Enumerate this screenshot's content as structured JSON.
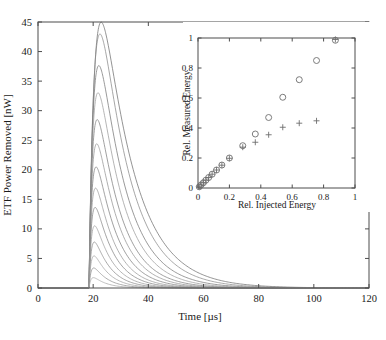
{
  "chart_data": [
    {
      "id": "main",
      "type": "line",
      "title": "",
      "xlabel": "Time [µs]",
      "ylabel": "ETF Power Removed [nW]",
      "xlim": [
        0,
        120
      ],
      "ylim": [
        0,
        45
      ],
      "xticks": [
        0,
        20,
        40,
        60,
        80,
        100,
        120
      ],
      "yticks": [
        0,
        5,
        10,
        15,
        20,
        25,
        30,
        35,
        40,
        45
      ],
      "grid": false,
      "legend": "none",
      "pulse_start_us": 18.5,
      "series_note": "14 pulse-response curves; each rises sharply at t=18.5 us, peaks between t=20 and t=25 us, then decays exponentially toward 0 by t~90 us.",
      "series": [
        {
          "name": "curve-01",
          "peak_value": 43.0,
          "peak_time_us": 24.6,
          "decay_tau_us": 11.5,
          "rise_tau_us": 2.6,
          "color": "#707070"
        },
        {
          "name": "curve-02",
          "peak_value": 42.2,
          "peak_time_us": 23.4,
          "decay_tau_us": 10.6,
          "rise_tau_us": 2.3,
          "color": "#8a8a8a"
        },
        {
          "name": "curve-03",
          "peak_value": 37.6,
          "peak_time_us": 22.2,
          "decay_tau_us": 9.8,
          "rise_tau_us": 2.0,
          "color": "#787878"
        },
        {
          "name": "curve-04",
          "peak_value": 33.0,
          "peak_time_us": 21.6,
          "decay_tau_us": 9.2,
          "rise_tau_us": 1.8,
          "color": "#9c9c9c"
        },
        {
          "name": "curve-05",
          "peak_value": 28.4,
          "peak_time_us": 21.2,
          "decay_tau_us": 8.6,
          "rise_tau_us": 1.6,
          "color": "#808080"
        },
        {
          "name": "curve-06",
          "peak_value": 24.2,
          "peak_time_us": 20.9,
          "decay_tau_us": 8.1,
          "rise_tau_us": 1.5,
          "color": "#949494"
        },
        {
          "name": "curve-07",
          "peak_value": 20.2,
          "peak_time_us": 20.6,
          "decay_tau_us": 7.6,
          "rise_tau_us": 1.35,
          "color": "#828282"
        },
        {
          "name": "curve-08",
          "peak_value": 16.6,
          "peak_time_us": 20.4,
          "decay_tau_us": 7.1,
          "rise_tau_us": 1.25,
          "color": "#9a9a9a"
        },
        {
          "name": "curve-09",
          "peak_value": 13.3,
          "peak_time_us": 20.2,
          "decay_tau_us": 6.7,
          "rise_tau_us": 1.15,
          "color": "#868686"
        },
        {
          "name": "curve-10",
          "peak_value": 10.3,
          "peak_time_us": 20.1,
          "decay_tau_us": 6.3,
          "rise_tau_us": 1.05,
          "color": "#9e9e9e"
        },
        {
          "name": "curve-11",
          "peak_value": 7.6,
          "peak_time_us": 20.0,
          "decay_tau_us": 5.9,
          "rise_tau_us": 1.0,
          "color": "#8c8c8c"
        },
        {
          "name": "curve-12",
          "peak_value": 5.3,
          "peak_time_us": 19.9,
          "decay_tau_us": 5.5,
          "rise_tau_us": 0.95,
          "color": "#a2a2a2"
        },
        {
          "name": "curve-13",
          "peak_value": 3.3,
          "peak_time_us": 19.8,
          "decay_tau_us": 5.1,
          "rise_tau_us": 0.9,
          "color": "#909090"
        },
        {
          "name": "curve-14",
          "peak_value": 1.7,
          "peak_time_us": 19.7,
          "decay_tau_us": 4.7,
          "rise_tau_us": 0.85,
          "color": "#a6a6a6"
        }
      ]
    },
    {
      "id": "inset",
      "type": "scatter",
      "title": "",
      "xlabel": "Rel. Injected Energy",
      "ylabel": "Rel. Measured Energy",
      "xlim": [
        0,
        1
      ],
      "ylim": [
        0,
        1
      ],
      "xticks": [
        0,
        0.2,
        0.4,
        0.6,
        0.8,
        1
      ],
      "yticks": [
        0,
        0.2,
        0.4,
        0.6,
        0.8,
        1
      ],
      "grid": false,
      "legend": "none",
      "series": [
        {
          "name": "circle-series",
          "marker": "o",
          "color": "#6e6e6e",
          "points": [
            [
              0.008,
              0.008
            ],
            [
              0.02,
              0.021
            ],
            [
              0.034,
              0.035
            ],
            [
              0.05,
              0.052
            ],
            [
              0.068,
              0.07
            ],
            [
              0.09,
              0.092
            ],
            [
              0.118,
              0.12
            ],
            [
              0.152,
              0.153
            ],
            [
              0.2,
              0.2
            ],
            [
              0.285,
              0.282
            ],
            [
              0.365,
              0.36
            ],
            [
              0.45,
              0.47
            ],
            [
              0.54,
              0.605
            ],
            [
              0.645,
              0.722
            ],
            [
              0.755,
              0.85
            ],
            [
              0.875,
              0.985
            ]
          ]
        },
        {
          "name": "plus-series",
          "marker": "+",
          "color": "#6e6e6e",
          "points": [
            [
              0.008,
              0.008
            ],
            [
              0.02,
              0.021
            ],
            [
              0.034,
              0.035
            ],
            [
              0.05,
              0.052
            ],
            [
              0.068,
              0.07
            ],
            [
              0.09,
              0.092
            ],
            [
              0.118,
              0.12
            ],
            [
              0.152,
              0.152
            ],
            [
              0.2,
              0.198
            ],
            [
              0.285,
              0.272
            ],
            [
              0.365,
              0.305
            ],
            [
              0.45,
              0.355
            ],
            [
              0.54,
              0.405
            ],
            [
              0.645,
              0.432
            ],
            [
              0.755,
              0.448
            ],
            [
              0.875,
              0.99
            ]
          ]
        }
      ]
    }
  ],
  "figure": {
    "main": {
      "xlabel": "Time [µs]",
      "ylabel": "ETF Power Removed [nW]",
      "xticklabels": [
        "0",
        "20",
        "40",
        "60",
        "80",
        "100",
        "120"
      ],
      "yticklabels": [
        "0",
        "5",
        "10",
        "15",
        "20",
        "25",
        "30",
        "35",
        "40",
        "45"
      ]
    },
    "inset": {
      "xlabel": "Rel. Injected Energy",
      "ylabel": "Rel. Measured Energy",
      "xticklabels": [
        "0",
        "0.2",
        "0.4",
        "0.6",
        "0.8",
        "1"
      ],
      "yticklabels": [
        "0",
        "0.2",
        "0.4",
        "0.6",
        "0.8",
        "1"
      ]
    }
  }
}
